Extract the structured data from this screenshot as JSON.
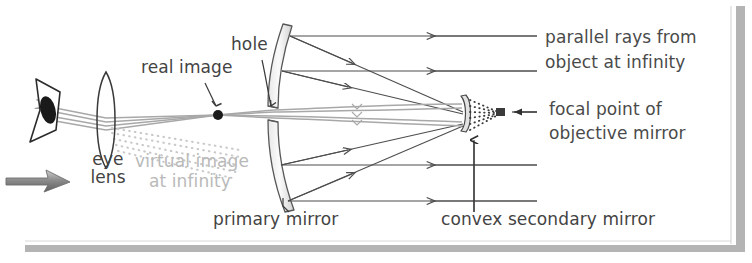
{
  "figure": {
    "width": 752,
    "height": 263,
    "background": "#ffffff",
    "border_color": "#b0b0b0",
    "ray_color_solid": "#4d4d4d",
    "ray_color_gray": "#a8a8a8",
    "label_color": "#4a4a4a",
    "faded_label_color": "#b9b9b9"
  },
  "labels": {
    "hole": "hole",
    "real_image": "real image",
    "eye_lens_line1": "eye",
    "eye_lens_line2": "lens",
    "virtual_image_line1": "virtual image",
    "virtual_image_line2": "at infinity",
    "primary_mirror": "primary mirror",
    "parallel_rays_line1": "parallel rays from",
    "parallel_rays_line2": "object at infinity",
    "focal_point_line1": "focal point of",
    "focal_point_line2": "objective mirror",
    "convex_secondary_mirror": "convex secondary mirror"
  },
  "components": {
    "eye": "eye-with-pupil",
    "eye_lens": "biconvex-lens",
    "primary_mirror": "concave-mirror-with-central-hole",
    "secondary_mirror": "convex-secondary-mirror",
    "real_image_point": "filled-dot",
    "focal_point": "focal-point-marker",
    "direction_arrow": "light-direction-arrow"
  },
  "ray_counts": {
    "parallel_incoming_rays": 4,
    "reflected_to_secondary": 4,
    "through_hole_gray_bundle": 4,
    "virtual_image_dotted_rays": 4,
    "focal_dotted_rays": 6
  }
}
